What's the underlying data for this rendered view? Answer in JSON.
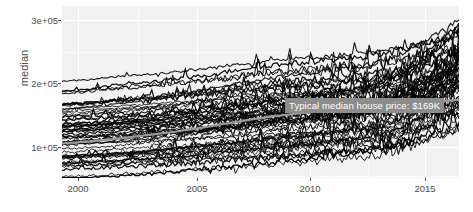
{
  "chart_data": {
    "type": "line",
    "title": "",
    "xlabel": "",
    "ylabel": "median",
    "xlim": [
      1999.0,
      2015.8
    ],
    "ylim": [
      45000,
      318000
    ],
    "xticks": [
      2000,
      2005,
      2010,
      2015
    ],
    "xtick_labels": [
      "2000",
      "2005",
      "2010",
      "2015"
    ],
    "yticks": [
      100000,
      200000,
      300000
    ],
    "ytick_labels": [
      "1e+05",
      "2e+05",
      "3e+05"
    ],
    "grid": true,
    "legend": "none",
    "annotations": [
      {
        "text": "Typical median house price: $169K",
        "x": 2009.4,
        "y": 172000,
        "style": "gray-label-box"
      }
    ],
    "highlight_series": {
      "name": "typical median",
      "color": "#9a9a9a",
      "x": [
        2000,
        2001,
        2002,
        2003,
        2004,
        2005,
        2006,
        2007,
        2008,
        2009,
        2010,
        2011,
        2012,
        2013,
        2014,
        2015
      ],
      "values": [
        100000,
        103000,
        107000,
        112000,
        117000,
        123000,
        130000,
        137000,
        143000,
        148000,
        152000,
        156000,
        159000,
        162000,
        166000,
        169000
      ]
    },
    "series_note": "~60 overlapping black metro-level median price lines, monthly resolution",
    "series": [
      {
        "name": "line-1",
        "color": "#000000",
        "values": [
          182000,
          184000,
          188000,
          190000,
          193000,
          196000,
          200000,
          205000,
          208000,
          210000,
          213000,
          215000,
          218000,
          224000,
          232000,
          238000
        ]
      },
      {
        "name": "line-2",
        "color": "#000000",
        "values": [
          152000,
          155000,
          158000,
          161000,
          166000,
          170000,
          176000,
          181000,
          185000,
          188000,
          192000,
          196000,
          200000,
          211000,
          226000,
          243000
        ]
      },
      {
        "name": "line-3",
        "color": "#000000",
        "values": [
          140000,
          143000,
          146000,
          150000,
          153000,
          157000,
          162000,
          166000,
          170000,
          173000,
          177000,
          181000,
          187000,
          200000,
          218000,
          236000
        ]
      },
      {
        "name": "line-4",
        "color": "#000000",
        "values": [
          128000,
          130000,
          133000,
          136000,
          140000,
          144000,
          148000,
          152000,
          156000,
          159000,
          163000,
          167000,
          173000,
          188000,
          210000,
          232000
        ]
      },
      {
        "name": "line-5",
        "color": "#000000",
        "values": [
          116000,
          118000,
          121000,
          124000,
          127000,
          131000,
          135000,
          139000,
          143000,
          146000,
          150000,
          154000,
          160000,
          175000,
          196000,
          220000
        ]
      },
      {
        "name": "line-6",
        "color": "#000000",
        "values": [
          104000,
          106000,
          109000,
          112000,
          115000,
          118000,
          122000,
          126000,
          130000,
          133000,
          137000,
          141000,
          147000,
          161000,
          182000,
          205000
        ]
      },
      {
        "name": "line-7",
        "color": "#000000",
        "values": [
          92000,
          94000,
          96000,
          99000,
          102000,
          105000,
          109000,
          113000,
          117000,
          120000,
          124000,
          128000,
          134000,
          148000,
          168000,
          190000
        ]
      },
      {
        "name": "line-8",
        "color": "#000000",
        "values": [
          80000,
          82000,
          84000,
          87000,
          90000,
          93000,
          96000,
          100000,
          104000,
          107000,
          111000,
          115000,
          120000,
          133000,
          152000,
          174000
        ]
      },
      {
        "name": "line-9",
        "color": "#000000",
        "values": [
          70000,
          72000,
          74000,
          76000,
          79000,
          82000,
          85000,
          88000,
          92000,
          95000,
          99000,
          103000,
          108000,
          120000,
          138000,
          158000
        ]
      },
      {
        "name": "line-10",
        "color": "#000000",
        "values": [
          60000,
          62000,
          64000,
          66000,
          68000,
          71000,
          74000,
          77000,
          80000,
          83000,
          87000,
          91000,
          96000,
          107000,
          124000,
          142000
        ]
      }
    ]
  },
  "annotation": {
    "label": "Typical median house price: $169K"
  },
  "axes": {
    "y_title": "median",
    "y_labels": [
      "3e+05",
      "2e+05",
      "1e+05"
    ],
    "x_labels": [
      "2000",
      "2005",
      "2010",
      "2015"
    ]
  }
}
